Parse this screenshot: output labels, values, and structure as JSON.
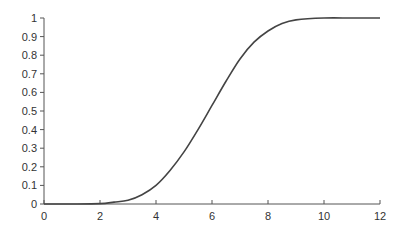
{
  "chart_data": {
    "type": "line",
    "title": "",
    "xlabel": "",
    "ylabel": "",
    "xlim": [
      0,
      12
    ],
    "ylim": [
      0,
      1
    ],
    "grid": false,
    "legend": null,
    "x_ticks": [
      "0",
      "2",
      "4",
      "6",
      "8",
      "10",
      "12"
    ],
    "y_ticks": [
      "0",
      "0.1",
      "0.2",
      "0.3",
      "0.4",
      "0.5",
      "0.6",
      "0.7",
      "0.8",
      "0.9",
      "1"
    ],
    "series": [
      {
        "name": "cumulative curve",
        "color": "#444444",
        "x": [
          0,
          1,
          2,
          2.5,
          3,
          3.5,
          4,
          4.5,
          5,
          5.5,
          6,
          6.5,
          7,
          7.5,
          8,
          8.5,
          9,
          10,
          11,
          12
        ],
        "y": [
          0,
          0,
          0.002,
          0.01,
          0.02,
          0.05,
          0.1,
          0.18,
          0.28,
          0.4,
          0.53,
          0.66,
          0.78,
          0.87,
          0.93,
          0.97,
          0.99,
          1.0,
          1.0,
          1.0
        ]
      }
    ]
  }
}
